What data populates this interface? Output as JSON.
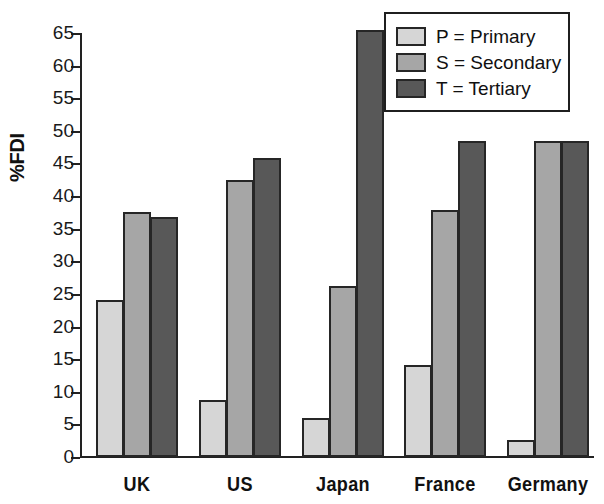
{
  "chart_data": {
    "type": "bar",
    "title": "",
    "xlabel": "",
    "ylabel": "%FDI",
    "ylim": [
      0,
      65
    ],
    "ytick_step": 5,
    "yticks": [
      0,
      5,
      10,
      15,
      20,
      25,
      30,
      35,
      40,
      45,
      50,
      55,
      60,
      65
    ],
    "grid": false,
    "legend_position": "top-right",
    "categories": [
      "UK",
      "US",
      "Japan",
      "France",
      "Germany"
    ],
    "series": [
      {
        "name": "P = Primary",
        "key": "P",
        "color": "#d6d6d6",
        "values": [
          24.0,
          8.7,
          6.0,
          14.1,
          2.6
        ]
      },
      {
        "name": "S = Secondary",
        "key": "S",
        "color": "#a6a6a6",
        "values": [
          37.6,
          42.4,
          26.2,
          37.9,
          48.5
        ]
      },
      {
        "name": "T = Tertiary",
        "key": "T",
        "color": "#585858",
        "values": [
          36.8,
          45.8,
          65.4,
          48.5,
          48.5
        ]
      }
    ]
  },
  "axis": {
    "y_title": "%FDI",
    "tick_labels": [
      "0",
      "5",
      "10",
      "15",
      "20",
      "25",
      "30",
      "35",
      "40",
      "45",
      "50",
      "55",
      "60",
      "65"
    ]
  },
  "legend": {
    "items": [
      {
        "label": "P = Primary"
      },
      {
        "label": "S = Secondary"
      },
      {
        "label": "T = Tertiary"
      }
    ]
  },
  "colors": {
    "primary": "#d6d6d6",
    "secondary": "#a6a6a6",
    "tertiary": "#585858",
    "outline": "#262626",
    "background": "#ffffff"
  }
}
